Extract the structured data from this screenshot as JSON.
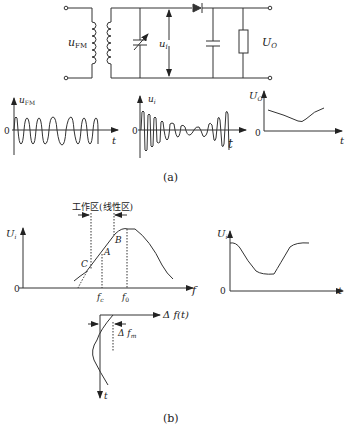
{
  "figure_a": {
    "caption": "(a)",
    "circuit": {
      "input_label": "u",
      "input_sub": "FM",
      "tank_voltage_label": "u",
      "tank_voltage_sub": "i",
      "output_label": "U",
      "output_sub": "O"
    },
    "waveform_fm": {
      "y_label": "u",
      "y_sub": "FM",
      "origin": "0",
      "x_label": "t"
    },
    "waveform_ui": {
      "y_label": "u",
      "y_sub": "i",
      "origin": "0",
      "x_label": "t"
    },
    "waveform_uo": {
      "y_label": "U",
      "y_sub": "O",
      "origin": "0",
      "x_label": "t"
    }
  },
  "figure_b": {
    "caption": "(b)",
    "resonance_curve": {
      "region_label": "工作区(线性区)",
      "y_label": "U",
      "y_sub": "i",
      "origin": "0",
      "x_label": "f",
      "point_a": "A",
      "point_b": "B",
      "point_c": "C",
      "fc_label": "f",
      "fc_sub": "c",
      "f0_label": "f",
      "f0_sub": "0"
    },
    "envelope": {
      "y_label": "U",
      "y_sub": "i",
      "origin": "0",
      "x_label": "t"
    },
    "deviation": {
      "x_label": "Δ f(t)",
      "delta_label": "Δ f",
      "delta_sub": "m",
      "t_label": "t"
    }
  }
}
